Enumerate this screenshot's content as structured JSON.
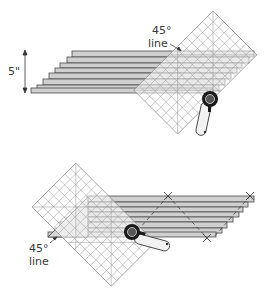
{
  "diagrams": [
    {
      "id": "top",
      "description": "Stacked fabric strips (strata) with 45-degree ruler line aligned, rotary cutter trimming right end",
      "labels": {
        "height_dimension": "5\"",
        "ruler_line": "45°",
        "ruler_line_word": "line"
      }
    },
    {
      "id": "bottom",
      "description": "Ruler rotated to left end of strata with 45-degree line on bottom edge; rotary cutter cuts; X marks indicate alignment points",
      "labels": {
        "ruler_line": "45°",
        "ruler_line_word": "line"
      }
    }
  ],
  "colors": {
    "strip_fill": "#c9c9c9",
    "strip_stroke": "#4a4a4a",
    "grid_stroke": "#8a8a8a",
    "cutter_dark": "#1a1a1a",
    "text": "#3a3a3a"
  }
}
